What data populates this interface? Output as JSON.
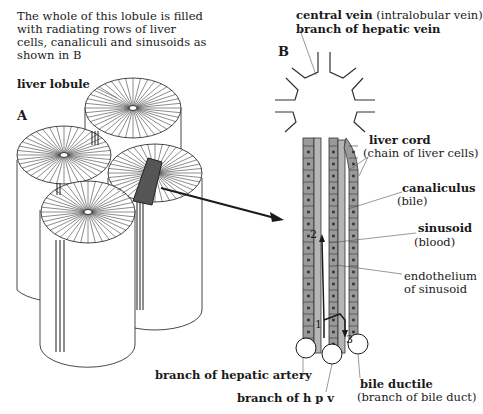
{
  "intro_text": "The whole of this lobule is filled with radiating rows of liver cells, canaliculi and sinusoids as shown in B",
  "panels": {
    "a": "A",
    "b": "B"
  },
  "labels": {
    "liver_lobule": "liver lobule",
    "central_vein": "central vein",
    "central_vein_note": "(intralobular vein)",
    "branch_hepatic_vein": "branch of hepatic vein",
    "liver_cord": "liver cord",
    "liver_cord_note": "(chain of liver cells)",
    "canaliculus": "canaliculus",
    "canaliculus_note": "(bile)",
    "sinusoid": "sinusoid",
    "sinusoid_note": "(blood)",
    "endothelium": "endothelium",
    "endothelium_note": "of sinusoid",
    "branch_hepatic_artery": "branch of hepatic artery",
    "branch_hpv": "branch of h p v",
    "bile_ductile": "bile ductile",
    "bile_ductile_note": "(branch of bile duct)"
  },
  "flow_markers": [
    "1",
    "2",
    "3"
  ],
  "colors": {
    "ink": "#1a1a1a",
    "cord_fill": "#9a9a9a",
    "cord_dark": "#5a5a5a",
    "highlight": "#444444"
  }
}
